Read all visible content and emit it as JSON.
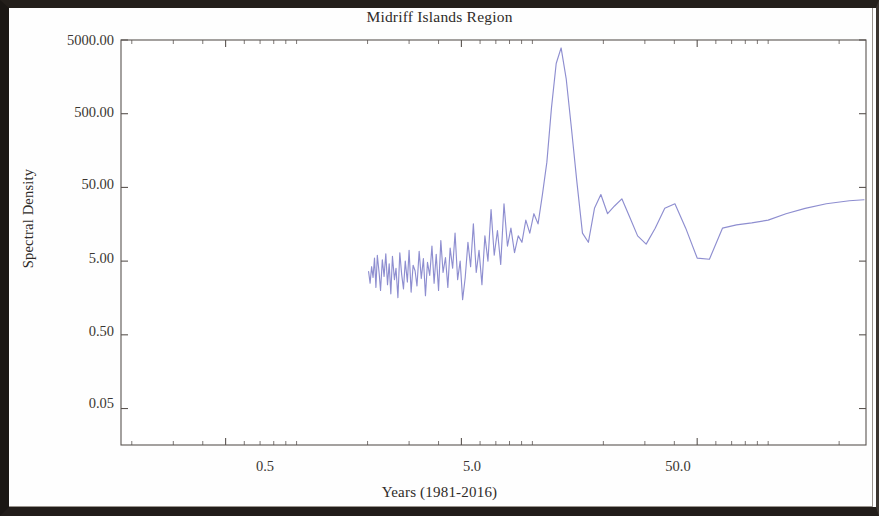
{
  "chart_data": {
    "type": "line",
    "title": "Midriff Islands Region",
    "xlabel": "Years (1981-2016)",
    "ylabel": "Spectral Density",
    "xscale": "log",
    "yscale": "log",
    "grid": false,
    "legend": null,
    "line_color": "#8e8ed0",
    "xticks": [
      0.5,
      5.0,
      50.0
    ],
    "xtick_labels": [
      "0.5",
      "5.0",
      "50.0"
    ],
    "yticks": [
      0.05,
      0.5,
      5.0,
      50.0,
      500.0,
      5000.0
    ],
    "ytick_labels": [
      "0.05",
      "0.50",
      "5.00",
      "50.00",
      "500.00",
      "5000.00"
    ],
    "xlim": [
      0.18,
      260.0
    ],
    "ylim": [
      0.016,
      5000.0
    ],
    "series": [
      {
        "name": "Spectral Density",
        "x": [
          2.02,
          2.05,
          2.08,
          2.11,
          2.14,
          2.17,
          2.2,
          2.24,
          2.27,
          2.31,
          2.35,
          2.39,
          2.43,
          2.47,
          2.51,
          2.55,
          2.6,
          2.64,
          2.69,
          2.74,
          2.79,
          2.84,
          2.89,
          2.95,
          3.0,
          3.06,
          3.12,
          3.18,
          3.24,
          3.31,
          3.38,
          3.45,
          3.52,
          3.59,
          3.67,
          3.75,
          3.83,
          3.91,
          4.0,
          4.09,
          4.18,
          4.28,
          4.38,
          4.48,
          4.59,
          4.7,
          4.82,
          4.94,
          5.06,
          5.19,
          5.33,
          5.47,
          5.62,
          5.78,
          5.94,
          6.11,
          6.29,
          6.48,
          6.68,
          6.89,
          7.11,
          7.34,
          7.58,
          7.84,
          8.11,
          8.4,
          8.71,
          9.03,
          9.38,
          9.75,
          10.15,
          10.57,
          11.03,
          11.52,
          12.05,
          12.62,
          13.24,
          13.91,
          14.64,
          15.44,
          16.31,
          17.28,
          18.34,
          19.52,
          20.84,
          22.31,
          23.96,
          25.83,
          27.95,
          30.38,
          33.18,
          36.43,
          40.23,
          44.7,
          50.0,
          56.35,
          64.0,
          73.4,
          85.2,
          100.0,
          119.0,
          143.5,
          176.5,
          221.0,
          255.0
        ],
        "y": [
          3.6,
          2.5,
          4.2,
          3.0,
          5.5,
          2.2,
          6.0,
          3.4,
          2.0,
          5.2,
          3.1,
          6.3,
          2.4,
          4.6,
          1.8,
          5.8,
          2.8,
          4.0,
          1.6,
          6.5,
          3.3,
          2.1,
          5.0,
          2.6,
          7.0,
          1.9,
          4.4,
          3.7,
          2.3,
          6.8,
          2.9,
          5.4,
          1.7,
          4.8,
          3.2,
          8.0,
          2.5,
          6.2,
          2.0,
          9.5,
          3.5,
          5.6,
          2.2,
          7.5,
          4.0,
          12.0,
          2.8,
          5.0,
          1.5,
          3.0,
          9.0,
          4.2,
          16.0,
          3.5,
          7.0,
          2.4,
          11.0,
          5.0,
          25.0,
          6.0,
          13.0,
          4.5,
          30.0,
          8.0,
          14.0,
          6.5,
          11.0,
          9.0,
          18.0,
          12.0,
          22.0,
          16.0,
          40.0,
          110.0,
          600.0,
          2400.0,
          3900.0,
          1500.0,
          320.0,
          60.0,
          12.0,
          9.0,
          26.0,
          40.0,
          22.0,
          28.0,
          35.0,
          20.0,
          11.0,
          8.5,
          14.0,
          26.0,
          30.0,
          14.0,
          5.5,
          5.3,
          14.0,
          15.5,
          16.5,
          18.0,
          22.0,
          26.0,
          30.0,
          33.0,
          34.0
        ]
      }
    ]
  },
  "axes": {
    "title": "Midriff Islands Region",
    "ylabel": "Spectral Density",
    "xlabel": "Years (1981-2016)",
    "ytick_labels": [
      "5000.00",
      "500.00",
      "50.00",
      "5.00",
      "0.50",
      "0.05"
    ],
    "xtick_labels": [
      "0.5",
      "5.0",
      "50.0"
    ]
  }
}
